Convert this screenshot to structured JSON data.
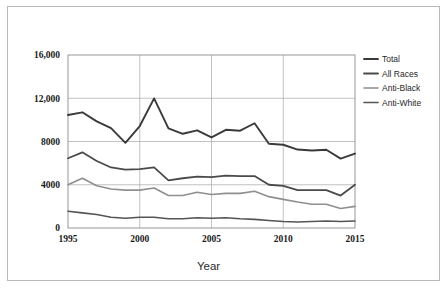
{
  "figure": {
    "border_color": "#b9b9b9",
    "background": "#ffffff"
  },
  "chart_data": {
    "type": "line",
    "title": "",
    "subtitle": "",
    "xlabel": "Year",
    "ylabel": "",
    "grid": true,
    "legend_position": "right",
    "xlim": [
      1995,
      2015
    ],
    "ylim": [
      0,
      16000
    ],
    "x": [
      1995,
      1996,
      1997,
      1998,
      1999,
      2000,
      2001,
      2002,
      2003,
      2004,
      2005,
      2006,
      2007,
      2008,
      2009,
      2010,
      2011,
      2012,
      2013,
      2014,
      2015
    ],
    "xticks": [
      1995,
      2000,
      2005,
      2010,
      2015
    ],
    "xticklabels": [
      "1995",
      "2000",
      "2005",
      "2010",
      "2015"
    ],
    "yticks": [
      0,
      4000,
      8000,
      12000,
      16000
    ],
    "yticklabels": [
      "0",
      "4000",
      "8000",
      "12,000",
      "16,000"
    ],
    "series": [
      {
        "name": "Total",
        "color": "#3a3a3a",
        "width": 1.9,
        "values": [
          10450,
          10700,
          9860,
          9235,
          7876,
          9430,
          11987,
          9222,
          8715,
          9035,
          8380,
          9080,
          8999,
          9691,
          7789,
          7699,
          7254,
          7164,
          7242,
          6418,
          6885
        ]
      },
      {
        "name": "All Races",
        "color": "#4a4a4a",
        "width": 1.8,
        "values": [
          6450,
          7000,
          6200,
          5600,
          5400,
          5450,
          5600,
          4400,
          4600,
          4750,
          4700,
          4850,
          4800,
          4800,
          4000,
          3900,
          3500,
          3500,
          3500,
          3000,
          4000
        ]
      },
      {
        "name": "Anti-Black",
        "color": "#8f8f8f",
        "width": 1.6,
        "values": [
          4000,
          4600,
          3900,
          3600,
          3500,
          3500,
          3700,
          3000,
          3000,
          3300,
          3100,
          3200,
          3200,
          3400,
          2900,
          2650,
          2400,
          2200,
          2200,
          1800,
          2000
        ]
      },
      {
        "name": "Anti-White",
        "color": "#555555",
        "width": 1.6,
        "values": [
          1550,
          1400,
          1250,
          1000,
          900,
          1000,
          1000,
          850,
          850,
          950,
          900,
          950,
          850,
          800,
          700,
          600,
          550,
          600,
          650,
          600,
          650
        ]
      }
    ]
  },
  "legend": {
    "items": [
      {
        "label": "Total"
      },
      {
        "label": "All Races"
      },
      {
        "label": "Anti-Black"
      },
      {
        "label": "Anti-White"
      }
    ]
  },
  "axis": {
    "x_title": "Year"
  }
}
